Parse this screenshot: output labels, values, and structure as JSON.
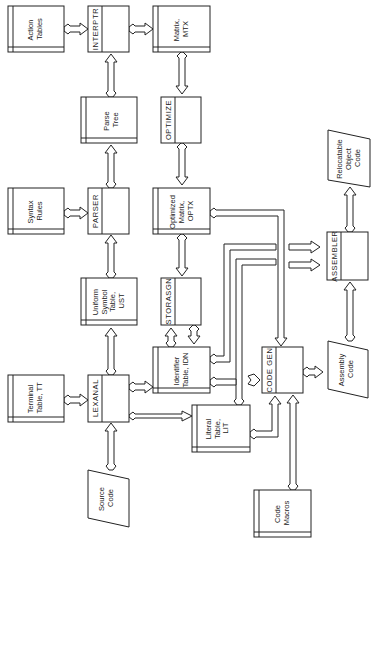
{
  "diagram": {
    "title": "",
    "orientation": "rotated-90-ccw",
    "processes": [
      {
        "id": "interptr",
        "label": "INTERPTR"
      },
      {
        "id": "optimize",
        "label": "OPTIMIZE"
      },
      {
        "id": "parser",
        "label": "PARSER"
      },
      {
        "id": "storasgn",
        "label": "STORASGN"
      },
      {
        "id": "lexanal",
        "label": "LEXANAL"
      },
      {
        "id": "codegen",
        "label": "CODE GEN"
      },
      {
        "id": "assembler",
        "label": "ASSEMBLER"
      }
    ],
    "databases": [
      {
        "id": "action_tables",
        "lines": [
          "Action",
          "Tables"
        ]
      },
      {
        "id": "matrix_mtx",
        "lines": [
          "Matrix,",
          "MTX"
        ]
      },
      {
        "id": "parse_tree",
        "lines": [
          "Parse",
          "Tree"
        ]
      },
      {
        "id": "syntax_rules",
        "lines": [
          "Syntax",
          "Rules"
        ]
      },
      {
        "id": "optimized_matrix",
        "lines": [
          "Optimized",
          "Matrix,",
          "OPTX"
        ]
      },
      {
        "id": "uniform_symbol_table",
        "lines": [
          "Uniform",
          "Symbol",
          "Table,",
          "UST"
        ]
      },
      {
        "id": "identifier_table",
        "lines": [
          "Identifier",
          "Table, IDN"
        ]
      },
      {
        "id": "terminal_table",
        "lines": [
          "Terminal",
          "Table, TT"
        ]
      },
      {
        "id": "literal_table",
        "lines": [
          "Literal",
          "Table,",
          "LIT"
        ]
      },
      {
        "id": "code_macros",
        "lines": [
          "Code",
          "Macros"
        ]
      }
    ],
    "io": [
      {
        "id": "relocatable_object_code",
        "lines": [
          "Relocatable",
          "Object",
          "Code"
        ]
      },
      {
        "id": "assembly_code",
        "lines": [
          "Assembly",
          "Code"
        ]
      },
      {
        "id": "source_code",
        "lines": [
          "Source",
          "Code"
        ]
      }
    ],
    "connections": [
      {
        "from": "Source Code",
        "to": "LEXANAL"
      },
      {
        "from": "Terminal Table, TT",
        "to": "LEXANAL"
      },
      {
        "from": "LEXANAL",
        "to": "Uniform Symbol Table, UST"
      },
      {
        "from": "LEXANAL",
        "to": "Identifier Table, IDN"
      },
      {
        "from": "LEXANAL",
        "to": "Literal Table, LIT"
      },
      {
        "from": "Uniform Symbol Table, UST",
        "to": "PARSER"
      },
      {
        "from": "Syntax Rules",
        "to": "PARSER"
      },
      {
        "from": "PARSER",
        "to": "Parse Tree"
      },
      {
        "from": "Parse Tree",
        "to": "INTERPTR"
      },
      {
        "from": "Action Tables",
        "to": "INTERPTR"
      },
      {
        "from": "INTERPTR",
        "to": "Matrix, MTX"
      },
      {
        "from": "Matrix, MTX",
        "to": "OPTIMIZE"
      },
      {
        "from": "OPTIMIZE",
        "to": "Optimized Matrix, OPTX"
      },
      {
        "from": "Optimized Matrix, OPTX",
        "to": "STORASGN"
      },
      {
        "from": "STORASGN",
        "to": "Identifier Table, IDN",
        "bidirectional": true
      },
      {
        "from": "Optimized Matrix, OPTX",
        "to": "CODE GEN"
      },
      {
        "from": "Identifier Table, IDN",
        "to": "CODE GEN"
      },
      {
        "from": "Identifier Table, IDN",
        "to": "ASSEMBLER"
      },
      {
        "from": "Literal Table, LIT",
        "to": "ASSEMBLER"
      },
      {
        "from": "Literal Table, LIT",
        "to": "CODE GEN"
      },
      {
        "from": "Code Macros",
        "to": "CODE GEN"
      },
      {
        "from": "CODE GEN",
        "to": "Assembly Code"
      },
      {
        "from": "Assembly Code",
        "to": "ASSEMBLER"
      },
      {
        "from": "ASSEMBLER",
        "to": "Relocatable Object Code"
      }
    ]
  }
}
